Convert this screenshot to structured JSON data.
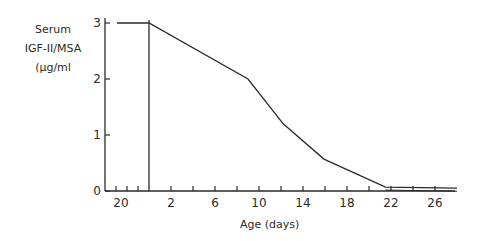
{
  "chart_data": {
    "type": "line",
    "title": "",
    "ylabel_lines": [
      "Serum",
      "IGF-II/MSA",
      "(µg/ml"
    ],
    "ylabel": "Serum IGF-II/MSA (µg/ml)",
    "xlabel": "Age (days)",
    "yticks": [
      "0",
      "1",
      "2",
      "3"
    ],
    "ylim": [
      0,
      3
    ],
    "xticks_fetal": [
      "20"
    ],
    "xticks_postnatal": [
      "2",
      "6",
      "10",
      "14",
      "18",
      "22",
      "26"
    ],
    "xlim_postnatal": [
      0,
      28
    ],
    "birth_marker": "vertical line at birth separating fetal (left) and postnatal (right) age",
    "grid": false,
    "legend": null,
    "series": [
      {
        "name": "Serum IGF-II/MSA",
        "fetal_points": [
          {
            "x": "fetal ~20",
            "y": 3.0
          },
          {
            "x": "birth",
            "y": 3.0
          }
        ],
        "points": [
          {
            "x": 0,
            "y": 3.0
          },
          {
            "x": 9,
            "y": 2.0
          },
          {
            "x": 12.2,
            "y": 1.2
          },
          {
            "x": 15.9,
            "y": 0.57
          },
          {
            "x": 21.5,
            "y": 0.07
          },
          {
            "x": 28,
            "y": 0.05
          }
        ]
      }
    ]
  }
}
